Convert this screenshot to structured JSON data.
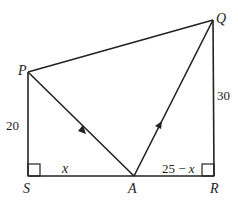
{
  "diagram": {
    "type": "geometry",
    "points": {
      "P": {
        "label": "P",
        "x": 28,
        "y": 72
      },
      "Q": {
        "label": "Q",
        "x": 213,
        "y": 20
      },
      "S": {
        "label": "S",
        "x": 28,
        "y": 176
      },
      "A": {
        "label": "A",
        "x": 134,
        "y": 176
      },
      "R": {
        "label": "R",
        "x": 214,
        "y": 176
      }
    },
    "segments": [
      {
        "from": "P",
        "to": "Q"
      },
      {
        "from": "P",
        "to": "S"
      },
      {
        "from": "S",
        "to": "R"
      },
      {
        "from": "Q",
        "to": "R"
      },
      {
        "from": "P",
        "to": "A",
        "arrow": true
      },
      {
        "from": "A",
        "to": "Q",
        "arrow": true
      }
    ],
    "right_angles": [
      "S",
      "R"
    ],
    "measures": {
      "PS": "20",
      "QR": "30",
      "SA": "x",
      "AR": "25 − x"
    },
    "colors": {
      "stroke": "#222222",
      "background": "#ffffff"
    }
  }
}
